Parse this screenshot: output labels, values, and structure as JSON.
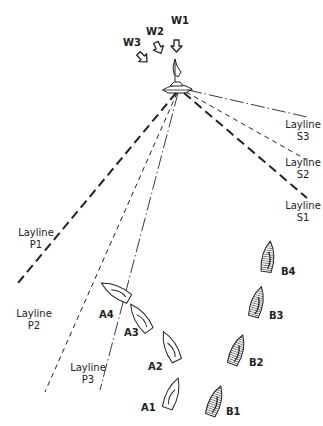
{
  "diagram": {
    "title": "",
    "wind_labels": [
      {
        "id": "W1",
        "x": 176,
        "y": 24
      },
      {
        "id": "W2",
        "x": 152,
        "y": 34
      },
      {
        "id": "W3",
        "x": 131,
        "y": 44
      }
    ],
    "mark": {
      "x": 178,
      "y": 92
    },
    "laylines": [
      {
        "id": "P1",
        "label": "Layline",
        "sub": "P1",
        "end": [
          18,
          283
        ],
        "style": "long-dash"
      },
      {
        "id": "P2",
        "label": "Layline",
        "sub": "P2",
        "end": [
          45,
          392
        ],
        "style": "dash"
      },
      {
        "id": "P3",
        "label": "Layline",
        "sub": "P3",
        "end": [
          100,
          390
        ],
        "style": "dash-dot"
      },
      {
        "id": "S3",
        "label": "Layline",
        "sub": "S3",
        "end": [
          307,
          117
        ],
        "style": "dash-dot"
      },
      {
        "id": "S2",
        "label": "Layline",
        "sub": "S2",
        "end": [
          307,
          160
        ],
        "style": "dash"
      },
      {
        "id": "S1",
        "label": "Layline",
        "sub": "S1",
        "end": [
          307,
          198
        ],
        "style": "long-dash"
      }
    ],
    "layline_labels": {
      "P1": {
        "line1": "Layline",
        "line2": "P1"
      },
      "P2": {
        "line1": "Layline",
        "line2": "P2"
      },
      "P3": {
        "line1": "Layline",
        "line2": "P3"
      },
      "S1": {
        "line1": "Layline",
        "line2": "S1"
      },
      "S2": {
        "line1": "Layline",
        "line2": "S2"
      },
      "S3": {
        "line1": "Layline",
        "line2": "S3"
      }
    },
    "boats_a": [
      {
        "id": "A1",
        "label": "A1"
      },
      {
        "id": "A2",
        "label": "A2"
      },
      {
        "id": "A3",
        "label": "A3"
      },
      {
        "id": "A4",
        "label": "A4"
      }
    ],
    "boats_b": [
      {
        "id": "B1",
        "label": "B1"
      },
      {
        "id": "B2",
        "label": "B2"
      },
      {
        "id": "B3",
        "label": "B3"
      },
      {
        "id": "B4",
        "label": "B4"
      }
    ]
  }
}
